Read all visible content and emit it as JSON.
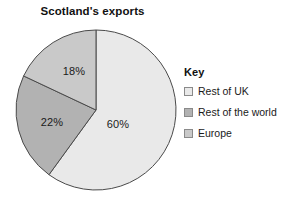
{
  "chart_data": {
    "type": "pie",
    "title": "Scotland's exports",
    "categories": [
      "Rest of UK",
      "Rest of the world",
      "Europe"
    ],
    "values": [
      60,
      22,
      18
    ],
    "value_labels": [
      "60%",
      "22%",
      "18%"
    ],
    "unit": "%",
    "colors": [
      "#e9e9e9",
      "#b2b2b2",
      "#c9c9c9"
    ],
    "stroke_color": "#4a4a4a",
    "start_angle_deg": 0,
    "direction": "clockwise",
    "legend_position": "right",
    "grid": false,
    "xlabel": "",
    "ylabel": "",
    "slices": [
      {
        "label": "Rest of UK",
        "value": 60,
        "value_label": "60%",
        "color": "#e9e9e9",
        "label_x": 118,
        "label_y": 124
      },
      {
        "label": "Rest of the world",
        "value": 22,
        "value_label": "22%",
        "color": "#b2b2b2",
        "label_x": 52,
        "label_y": 122
      },
      {
        "label": "Europe",
        "value": 18,
        "value_label": "18%",
        "color": "#c9c9c9",
        "label_x": 74,
        "label_y": 71
      }
    ]
  },
  "legend": {
    "title": "Key",
    "items": [
      {
        "label": "Rest of UK",
        "color": "#e9e9e9"
      },
      {
        "label": "Rest of the world",
        "color": "#b2b2b2"
      },
      {
        "label": "Europe",
        "color": "#c9c9c9"
      }
    ]
  },
  "geometry": {
    "center_x": 96,
    "center_y": 110,
    "radius": 80
  }
}
